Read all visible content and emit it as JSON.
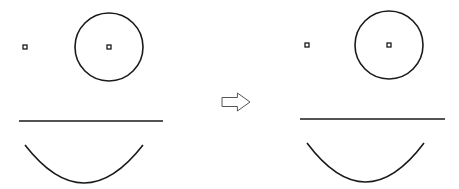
{
  "colors": {
    "stroke": "#1a1a1a",
    "background": "#ffffff",
    "arrow": "#555555"
  },
  "before": {
    "dot": {
      "x": 25,
      "y": 47
    },
    "circle": {
      "cx": 109,
      "cy": 47,
      "r": 34,
      "center_dot": true
    },
    "line": {
      "x1": 19,
      "y1": 121,
      "x2": 163,
      "y2": 121
    },
    "arc": {
      "x1": 25,
      "y1": 145,
      "x2": 143,
      "y2": 145,
      "bottom": 183
    }
  },
  "arrow": {
    "x": 222,
    "y": 93,
    "w": 28,
    "h": 18
  },
  "after": {
    "dot": {
      "x": 307,
      "y": 45
    },
    "circle": {
      "cx": 389,
      "cy": 45,
      "r": 34,
      "center_dot": true
    },
    "line": {
      "x1": 300,
      "y1": 119,
      "x2": 445,
      "y2": 119
    },
    "arc": {
      "x1": 307,
      "y1": 143,
      "x2": 424,
      "y2": 143,
      "bottom": 182
    }
  }
}
